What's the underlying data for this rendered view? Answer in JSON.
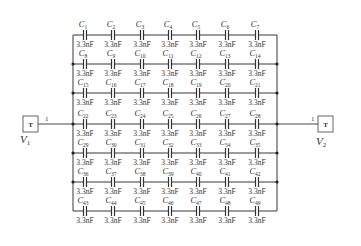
{
  "diagram": {
    "type": "capacitor-array-circuit",
    "rows": 7,
    "columns": 7,
    "capacitor_value": "3.3nF",
    "capacitors": [
      [
        "C1",
        "C2",
        "C3",
        "C4",
        "C5",
        "C6",
        "C7"
      ],
      [
        "C8",
        "C9",
        "C10",
        "C11",
        "C12",
        "C13",
        "C14"
      ],
      [
        "C15",
        "C16",
        "C17",
        "C18",
        "C19",
        "C20",
        "C21"
      ],
      [
        "C22",
        "C23",
        "C24",
        "C25",
        "C26",
        "C27",
        "C28"
      ],
      [
        "C29",
        "C30",
        "C31",
        "C32",
        "C33",
        "C34",
        "C35"
      ],
      [
        "C36",
        "C37",
        "C38",
        "C39",
        "C40",
        "C41",
        "C42"
      ],
      [
        "C43",
        "C44",
        "C45",
        "C46",
        "C47",
        "C48",
        "C49"
      ]
    ],
    "ports": {
      "left": {
        "symbol": "T",
        "name": "V",
        "subscript": "1",
        "pin": "1"
      },
      "right": {
        "symbol": "T",
        "name": "V",
        "subscript": "2",
        "pin": "1"
      }
    }
  },
  "colors": {
    "wire": "#4a4a4a",
    "text": "#333333",
    "background": "#ffffff"
  }
}
